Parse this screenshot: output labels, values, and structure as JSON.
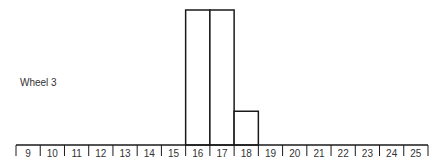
{
  "chart_data": {
    "type": "bar",
    "title": "",
    "row_label": "Wheel 3",
    "xlabel": "",
    "ylabel": "",
    "categories": [
      "9",
      "10",
      "11",
      "12",
      "13",
      "14",
      "15",
      "16",
      "17",
      "18",
      "19",
      "20",
      "21",
      "22",
      "23",
      "24",
      "25"
    ],
    "values": [
      0,
      0,
      0,
      0,
      0,
      0,
      0,
      4,
      4,
      1,
      0,
      0,
      0,
      0,
      0,
      0,
      0
    ],
    "ylim": [
      0,
      4
    ],
    "grid": false,
    "legend": null
  },
  "style": {
    "line_color": "#1a1a1a",
    "text_color": "#333333",
    "bar_fill": "#ffffff"
  }
}
